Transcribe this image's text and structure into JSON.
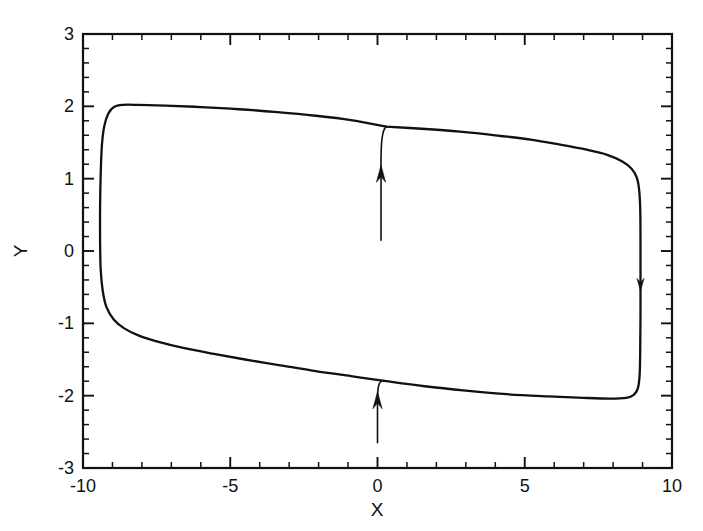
{
  "figure": {
    "title": "",
    "background_color": "#ffffff",
    "line_color": "#111111"
  },
  "chart_data": {
    "type": "line",
    "title": "",
    "subtitle": "",
    "xlabel": "X",
    "ylabel": "Y",
    "xlim": [
      -10,
      10
    ],
    "ylim": [
      -3,
      3
    ],
    "grid": false,
    "legend": null,
    "x_major_ticks": [
      -10,
      -5,
      0,
      5,
      10
    ],
    "x_major_tick_labels": [
      "-10",
      "-5",
      "0",
      "5",
      "10"
    ],
    "x_minor_tick_step": 1,
    "y_major_ticks": [
      -3,
      -2,
      -1,
      0,
      1,
      2,
      3
    ],
    "y_major_tick_labels": [
      "-3",
      "-2",
      "-1",
      "0",
      "1",
      "2",
      "3"
    ],
    "y_minor_tick_step": 0.2,
    "tick_direction": "in",
    "frame": "full-box",
    "series": [
      {
        "name": "limit-cycle",
        "kind": "closed-orbit",
        "direction": "clockwise",
        "comment": "relaxation-oscillator limit cycle, traversed clockwise",
        "points": [
          [
            0.3,
            1.72
          ],
          [
            1.5,
            1.69
          ],
          [
            2.8,
            1.65
          ],
          [
            4.0,
            1.6
          ],
          [
            5.2,
            1.54
          ],
          [
            6.2,
            1.47
          ],
          [
            7.1,
            1.4
          ],
          [
            7.8,
            1.33
          ],
          [
            8.3,
            1.24
          ],
          [
            8.62,
            1.14
          ],
          [
            8.8,
            1.02
          ],
          [
            8.88,
            0.86
          ],
          [
            8.92,
            0.6
          ],
          [
            8.93,
            0.2
          ],
          [
            8.93,
            -0.3
          ],
          [
            8.93,
            -0.9
          ],
          [
            8.92,
            -1.4
          ],
          [
            8.9,
            -1.72
          ],
          [
            8.84,
            -1.9
          ],
          [
            8.7,
            -1.99
          ],
          [
            8.45,
            -2.03
          ],
          [
            7.9,
            -2.04
          ],
          [
            7.0,
            -2.03
          ],
          [
            5.8,
            -2.01
          ],
          [
            4.4,
            -1.98
          ],
          [
            3.0,
            -1.93
          ],
          [
            1.6,
            -1.87
          ],
          [
            0.3,
            -1.8
          ],
          [
            -0.9,
            -1.73
          ],
          [
            -2.1,
            -1.66
          ],
          [
            -3.3,
            -1.58
          ],
          [
            -4.5,
            -1.5
          ],
          [
            -5.6,
            -1.42
          ],
          [
            -6.6,
            -1.34
          ],
          [
            -7.4,
            -1.26
          ],
          [
            -8.1,
            -1.17
          ],
          [
            -8.6,
            -1.07
          ],
          [
            -8.95,
            -0.95
          ],
          [
            -9.2,
            -0.78
          ],
          [
            -9.33,
            -0.55
          ],
          [
            -9.4,
            -0.25
          ],
          [
            -9.42,
            0.15
          ],
          [
            -9.42,
            0.6
          ],
          [
            -9.4,
            1.05
          ],
          [
            -9.36,
            1.45
          ],
          [
            -9.28,
            1.72
          ],
          [
            -9.14,
            1.9
          ],
          [
            -8.95,
            1.99
          ],
          [
            -8.65,
            2.02
          ],
          [
            -8.1,
            2.02
          ],
          [
            -7.2,
            2.01
          ],
          [
            -6.0,
            1.99
          ],
          [
            -4.7,
            1.96
          ],
          [
            -3.4,
            1.92
          ],
          [
            -2.1,
            1.87
          ],
          [
            -0.9,
            1.81
          ],
          [
            0.3,
            1.72
          ]
        ]
      },
      {
        "name": "transient-upper",
        "kind": "transient",
        "arrow": "up",
        "comment": "vertical transient at x~0.1 rising from y~0.15 into the upper branch",
        "points": [
          [
            0.12,
            0.15
          ],
          [
            0.12,
            0.6
          ],
          [
            0.12,
            1.0
          ],
          [
            0.12,
            1.3
          ],
          [
            0.14,
            1.5
          ],
          [
            0.18,
            1.62
          ],
          [
            0.24,
            1.69
          ],
          [
            0.32,
            1.72
          ]
        ],
        "arrow_at": [
          0.12,
          0.95
        ]
      },
      {
        "name": "transient-lower",
        "kind": "transient",
        "arrow": "up",
        "comment": "vertical transient at x~0.0 rising from y~-2.65 into the lower branch",
        "points": [
          [
            0.0,
            -2.65
          ],
          [
            0.0,
            -2.35
          ],
          [
            0.0,
            -2.1
          ],
          [
            0.01,
            -1.95
          ],
          [
            0.04,
            -1.86
          ],
          [
            0.1,
            -1.81
          ],
          [
            0.2,
            -1.79
          ]
        ],
        "arrow_at": [
          0.0,
          -2.18
        ]
      },
      {
        "name": "flow-arrow-right-branch",
        "kind": "direction-marker",
        "arrow": "down",
        "comment": "downward arrowhead on the right vertical branch indicating clockwise flow",
        "arrow_at": [
          8.93,
          -0.38
        ]
      }
    ],
    "annotations": [
      {
        "name": "arrow-upper-transient",
        "symbol": "up-arrow",
        "x": 0.12,
        "y": 0.95
      },
      {
        "name": "arrow-lower-transient",
        "symbol": "up-arrow",
        "x": 0.0,
        "y": -2.18
      },
      {
        "name": "arrow-right-branch",
        "symbol": "down-arrow",
        "x": 8.93,
        "y": -0.38
      }
    ]
  }
}
